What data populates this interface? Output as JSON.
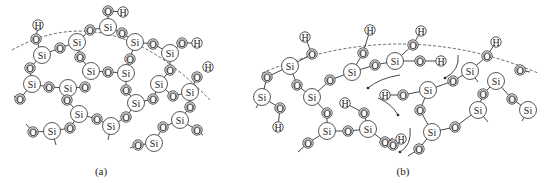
{
  "figure": {
    "panels": [
      {
        "id": "a",
        "caption": "(a)",
        "description": "Silica network with surface silanol groups (dashed line marks surface)"
      },
      {
        "id": "b",
        "caption": "(b)",
        "description": "Silica chains with surface OH groups and water molecules; arrows show migration"
      }
    ]
  },
  "labels": {
    "si": "Si",
    "o": "O",
    "h": "H"
  },
  "captions": {
    "a": "(a)",
    "b": "(b)"
  },
  "colors": {
    "stroke": "#444444",
    "background": "#ffffff"
  },
  "panel_a": {
    "surface_path": "M12,50 Q110,-5 210,100",
    "atoms": [
      {
        "t": "H",
        "x": 38,
        "y": 25
      },
      {
        "t": "O",
        "x": 36,
        "y": 39
      },
      {
        "t": "Si",
        "x": 42,
        "y": 55
      },
      {
        "t": "O",
        "x": 60,
        "y": 48
      },
      {
        "t": "Si",
        "x": 77,
        "y": 42
      },
      {
        "t": "O",
        "x": 90,
        "y": 30
      },
      {
        "t": "Si",
        "x": 108,
        "y": 27
      },
      {
        "t": "O",
        "x": 108,
        "y": 11
      },
      {
        "t": "H",
        "x": 123,
        "y": 12
      },
      {
        "t": "O",
        "x": 122,
        "y": 33
      },
      {
        "t": "Si",
        "x": 135,
        "y": 42
      },
      {
        "t": "O",
        "x": 153,
        "y": 44
      },
      {
        "t": "Si",
        "x": 170,
        "y": 53
      },
      {
        "t": "O",
        "x": 182,
        "y": 43
      },
      {
        "t": "H",
        "x": 197,
        "y": 43
      },
      {
        "t": "O",
        "x": 80,
        "y": 57
      },
      {
        "t": "Si",
        "x": 91,
        "y": 71
      },
      {
        "t": "O",
        "x": 108,
        "y": 72
      },
      {
        "t": "Si",
        "x": 126,
        "y": 73
      },
      {
        "t": "O",
        "x": 130,
        "y": 59
      },
      {
        "t": "O",
        "x": 30,
        "y": 68
      },
      {
        "t": "Si",
        "x": 32,
        "y": 84
      },
      {
        "t": "O",
        "x": 49,
        "y": 87
      },
      {
        "t": "Si",
        "x": 68,
        "y": 88
      },
      {
        "t": "O",
        "x": 85,
        "y": 87
      },
      {
        "t": "O",
        "x": 20,
        "y": 99
      },
      {
        "t": "O",
        "x": 126,
        "y": 90
      },
      {
        "t": "Si",
        "x": 136,
        "y": 103
      },
      {
        "t": "O",
        "x": 153,
        "y": 99
      },
      {
        "t": "Si",
        "x": 159,
        "y": 84
      },
      {
        "t": "O",
        "x": 170,
        "y": 70
      },
      {
        "t": "O",
        "x": 173,
        "y": 96
      },
      {
        "t": "Si",
        "x": 190,
        "y": 92
      },
      {
        "t": "O",
        "x": 197,
        "y": 77
      },
      {
        "t": "H",
        "x": 208,
        "y": 67
      },
      {
        "t": "O",
        "x": 67,
        "y": 100
      },
      {
        "t": "Si",
        "x": 79,
        "y": 114
      },
      {
        "t": "O",
        "x": 97,
        "y": 119
      },
      {
        "t": "Si",
        "x": 111,
        "y": 126
      },
      {
        "t": "O",
        "x": 126,
        "y": 117
      },
      {
        "t": "O",
        "x": 70,
        "y": 128
      },
      {
        "t": "Si",
        "x": 52,
        "y": 131
      },
      {
        "t": "O",
        "x": 33,
        "y": 132
      },
      {
        "t": "O",
        "x": 190,
        "y": 107
      },
      {
        "t": "Si",
        "x": 180,
        "y": 120
      },
      {
        "t": "O",
        "x": 163,
        "y": 127
      },
      {
        "t": "Si",
        "x": 154,
        "y": 143
      },
      {
        "t": "O",
        "x": 138,
        "y": 145
      },
      {
        "t": "O",
        "x": 197,
        "y": 130
      }
    ],
    "bonds": [
      [
        0,
        1
      ],
      [
        1,
        2
      ],
      [
        2,
        3
      ],
      [
        3,
        4
      ],
      [
        4,
        5
      ],
      [
        5,
        6
      ],
      [
        6,
        7
      ],
      [
        7,
        8
      ],
      [
        6,
        9
      ],
      [
        9,
        10
      ],
      [
        10,
        11
      ],
      [
        11,
        12
      ],
      [
        12,
        13
      ],
      [
        13,
        14
      ],
      [
        4,
        15
      ],
      [
        15,
        16
      ],
      [
        16,
        17
      ],
      [
        17,
        18
      ],
      [
        18,
        19
      ],
      [
        19,
        10
      ],
      [
        2,
        20
      ],
      [
        20,
        21
      ],
      [
        21,
        22
      ],
      [
        22,
        23
      ],
      [
        23,
        24
      ],
      [
        21,
        25
      ],
      [
        18,
        26
      ],
      [
        26,
        27
      ],
      [
        27,
        28
      ],
      [
        28,
        29
      ],
      [
        29,
        30
      ],
      [
        30,
        12
      ],
      [
        29,
        31
      ],
      [
        31,
        32
      ],
      [
        32,
        33
      ],
      [
        23,
        35
      ],
      [
        35,
        36
      ],
      [
        36,
        37
      ],
      [
        37,
        38
      ],
      [
        38,
        39
      ],
      [
        39,
        27
      ],
      [
        36,
        40
      ],
      [
        40,
        41
      ],
      [
        41,
        42
      ],
      [
        32,
        43
      ],
      [
        43,
        44
      ],
      [
        44,
        45
      ],
      [
        45,
        46
      ],
      [
        46,
        47
      ],
      [
        44,
        48
      ]
    ],
    "stubs": [
      [
        25,
        14,
        96
      ],
      [
        38,
        108,
        140
      ],
      [
        41,
        56,
        145
      ],
      [
        42,
        26,
        124
      ],
      [
        47,
        130,
        148
      ],
      [
        48,
        203,
        135
      ]
    ]
  },
  "panel_b": {
    "surface_path": "M262,73 Q400,15 538,73",
    "atoms": [
      {
        "t": "H",
        "x": 305,
        "y": 37
      },
      {
        "t": "O",
        "x": 312,
        "y": 54
      },
      {
        "t": "Si",
        "x": 290,
        "y": 66
      },
      {
        "t": "O",
        "x": 267,
        "y": 77
      },
      {
        "t": "Si",
        "x": 262,
        "y": 97
      },
      {
        "t": "O",
        "x": 280,
        "y": 108
      },
      {
        "t": "H",
        "x": 278,
        "y": 127
      },
      {
        "t": "O",
        "x": 297,
        "y": 85
      },
      {
        "t": "Si",
        "x": 312,
        "y": 97
      },
      {
        "t": "O",
        "x": 330,
        "y": 80
      },
      {
        "t": "Si",
        "x": 352,
        "y": 72
      },
      {
        "t": "O",
        "x": 363,
        "y": 53
      },
      {
        "t": "H",
        "x": 370,
        "y": 30
      },
      {
        "t": "O",
        "x": 375,
        "y": 65
      },
      {
        "t": "Si",
        "x": 395,
        "y": 61
      },
      {
        "t": "O",
        "x": 413,
        "y": 45
      },
      {
        "t": "H",
        "x": 421,
        "y": 31
      },
      {
        "t": "O",
        "x": 420,
        "y": 61
      },
      {
        "t": "H",
        "x": 441,
        "y": 61
      },
      {
        "t": "O",
        "x": 327,
        "y": 113
      },
      {
        "t": "Si",
        "x": 327,
        "y": 131
      },
      {
        "t": "O",
        "x": 348,
        "y": 131
      },
      {
        "t": "Si",
        "x": 368,
        "y": 129
      },
      {
        "t": "H",
        "x": 345,
        "y": 103
      },
      {
        "t": "O",
        "x": 364,
        "y": 113
      },
      {
        "t": "O",
        "x": 385,
        "y": 142
      },
      {
        "t": "O",
        "x": 308,
        "y": 143
      },
      {
        "t": "H",
        "x": 385,
        "y": 95
      },
      {
        "t": "O",
        "x": 403,
        "y": 95
      },
      {
        "t": "Si",
        "x": 428,
        "y": 90
      },
      {
        "t": "O",
        "x": 453,
        "y": 81
      },
      {
        "t": "Si",
        "x": 470,
        "y": 71
      },
      {
        "t": "O",
        "x": 487,
        "y": 56
      },
      {
        "t": "H",
        "x": 496,
        "y": 42
      },
      {
        "t": "O",
        "x": 420,
        "y": 110
      },
      {
        "t": "Si",
        "x": 432,
        "y": 132
      },
      {
        "t": "O",
        "x": 455,
        "y": 127
      },
      {
        "t": "Si",
        "x": 478,
        "y": 110
      },
      {
        "t": "O",
        "x": 483,
        "y": 94
      },
      {
        "t": "Si",
        "x": 496,
        "y": 81
      },
      {
        "t": "O",
        "x": 512,
        "y": 99
      },
      {
        "t": "Si",
        "x": 528,
        "y": 110
      },
      {
        "t": "O",
        "x": 520,
        "y": 70
      },
      {
        "t": "O",
        "x": 419,
        "y": 149
      },
      {
        "t": "O",
        "x": 393,
        "y": 145
      },
      {
        "t": "H",
        "x": 401,
        "y": 139
      }
    ],
    "bonds": [
      [
        0,
        1
      ],
      [
        1,
        2
      ],
      [
        2,
        3
      ],
      [
        3,
        4
      ],
      [
        4,
        5
      ],
      [
        5,
        6
      ],
      [
        2,
        7
      ],
      [
        7,
        8
      ],
      [
        8,
        9
      ],
      [
        9,
        10
      ],
      [
        10,
        11
      ],
      [
        11,
        12
      ],
      [
        10,
        13
      ],
      [
        13,
        14
      ],
      [
        14,
        15
      ],
      [
        15,
        16
      ],
      [
        14,
        17
      ],
      [
        17,
        18
      ],
      [
        8,
        19
      ],
      [
        19,
        20
      ],
      [
        20,
        21
      ],
      [
        21,
        22
      ],
      [
        23,
        24
      ],
      [
        24,
        22
      ],
      [
        22,
        25
      ],
      [
        20,
        26
      ],
      [
        27,
        28
      ],
      [
        28,
        29
      ],
      [
        29,
        30
      ],
      [
        30,
        31
      ],
      [
        31,
        32
      ],
      [
        32,
        33
      ],
      [
        29,
        34
      ],
      [
        34,
        35
      ],
      [
        35,
        36
      ],
      [
        36,
        37
      ],
      [
        37,
        38
      ],
      [
        38,
        39
      ],
      [
        39,
        40
      ],
      [
        40,
        41
      ],
      [
        35,
        43
      ],
      [
        44,
        45
      ]
    ],
    "stubs": [
      [
        4,
        256,
        108
      ],
      [
        26,
        298,
        152
      ],
      [
        31,
        478,
        82
      ],
      [
        37,
        488,
        122
      ],
      [
        41,
        522,
        121
      ],
      [
        42,
        530,
        72
      ],
      [
        43,
        408,
        156
      ],
      [
        25,
        393,
        138
      ]
    ],
    "arrows": [
      {
        "d": "M400,75 Q380,78 368,88",
        "head": [
          368,
          88
        ]
      },
      {
        "d": "M378,98 Q392,104 398,115",
        "head": [
          398,
          115
        ]
      },
      {
        "d": "M458,55 Q460,70 445,78",
        "head": [
          445,
          78
        ]
      },
      {
        "d": "M410,128 Q412,145 400,152",
        "head": [
          400,
          152
        ]
      }
    ]
  }
}
